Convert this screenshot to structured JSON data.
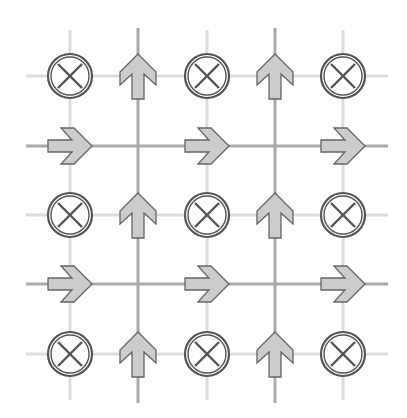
{
  "diagram": {
    "title": "",
    "grid": {
      "columns_x": [
        70,
        138,
        207,
        275,
        343
      ],
      "rows_y": [
        76,
        146,
        215,
        284,
        354
      ],
      "light_line_color": "#dddddd",
      "dark_line_color": "#aaaaaa",
      "light_vertical_columns": [
        0,
        2,
        4
      ],
      "dark_vertical_columns": [
        1,
        3
      ],
      "light_horizontal_rows": [
        0,
        2,
        4
      ],
      "dark_horizontal_rows": [
        1,
        3
      ],
      "x_extent": [
        26,
        388
      ],
      "y_extent": [
        28,
        403
      ]
    },
    "symbols": {
      "into_page": {
        "name": "circled-x",
        "radius": 22,
        "stroke": "#555555"
      },
      "up_arrow": {
        "name": "up-arrow",
        "fill": "#cccccc",
        "stroke": "#666666"
      },
      "right_arrow": {
        "name": "right-arrow",
        "fill": "#cccccc",
        "stroke": "#666666"
      }
    },
    "layout": [
      [
        "into_page",
        "up_arrow",
        "into_page",
        "up_arrow",
        "into_page"
      ],
      [
        "right_arrow",
        null,
        "right_arrow",
        null,
        "right_arrow"
      ],
      [
        "into_page",
        "up_arrow",
        "into_page",
        "up_arrow",
        "into_page"
      ],
      [
        "right_arrow",
        null,
        "right_arrow",
        null,
        "right_arrow"
      ],
      [
        "into_page",
        "up_arrow",
        "into_page",
        "up_arrow",
        "into_page"
      ]
    ]
  }
}
